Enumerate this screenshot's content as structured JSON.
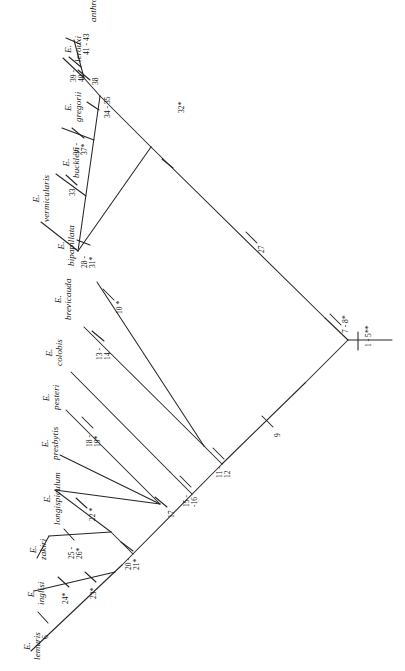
{
  "figure": {
    "type": "cladogram",
    "orientation": "rotated-90-counterclockwise",
    "ingroup_genus": "E."
  },
  "taxa": [
    {
      "id": "anthropopitheci",
      "genus": "E.",
      "species": "anthropopitheci"
    },
    {
      "id": "lerouxi",
      "genus": "E.",
      "species": "lerouxi"
    },
    {
      "id": "gregorii",
      "genus": "E.",
      "species": "gregorii"
    },
    {
      "id": "buckleyi",
      "genus": "E.",
      "species": "buckleyi"
    },
    {
      "id": "vermicularis",
      "genus": "E.",
      "species": "vermicularis"
    },
    {
      "id": "bipapillata",
      "genus": "E.",
      "species": "bipapillata"
    },
    {
      "id": "brevicauda",
      "genus": "E.",
      "species": "brevicauda"
    },
    {
      "id": "colobis",
      "genus": "E.",
      "species": "colobis"
    },
    {
      "id": "pesteri",
      "genus": "E.",
      "species": "pesteri"
    },
    {
      "id": "presbytis",
      "genus": "E.",
      "species": "presbytis"
    },
    {
      "id": "longispiculum",
      "genus": "E.",
      "species": "longispiculum"
    },
    {
      "id": "zakiri",
      "genus": "E.",
      "species": "zakiri"
    },
    {
      "id": "inglisi",
      "genus": "E.",
      "species": "inglisi"
    },
    {
      "id": "lemuris",
      "genus": "E.",
      "species": "lemuris"
    }
  ],
  "node_labels": [
    {
      "id": "n-41-43",
      "lines": [
        "41 - 43"
      ]
    },
    {
      "id": "n-39-40",
      "lines": [
        "39 -",
        "40"
      ]
    },
    {
      "id": "n-38",
      "lines": [
        "38"
      ]
    },
    {
      "id": "n-34-35",
      "lines": [
        "34 - 35"
      ]
    },
    {
      "id": "n-36-37",
      "lines": [
        "36 -",
        "37*"
      ]
    },
    {
      "id": "n-33",
      "lines": [
        "33"
      ]
    },
    {
      "id": "n-32",
      "lines": [
        "32*"
      ]
    },
    {
      "id": "n-28-31",
      "lines": [
        "28 -",
        "31*"
      ]
    },
    {
      "id": "n-27",
      "lines": [
        "27"
      ]
    },
    {
      "id": "n-10",
      "lines": [
        "10 *"
      ]
    },
    {
      "id": "n-13-14",
      "lines": [
        "13 -",
        "14"
      ]
    },
    {
      "id": "n-9",
      "lines": [
        "9"
      ]
    },
    {
      "id": "n-7-8",
      "lines": [
        "7 - 8*"
      ]
    },
    {
      "id": "n-1-5",
      "lines": [
        "1 - 5**"
      ]
    },
    {
      "id": "n-11-12",
      "lines": [
        "11 -",
        "12"
      ]
    },
    {
      "id": "n-15-16",
      "lines": [
        "15 -",
        "-16"
      ]
    },
    {
      "id": "n-18-19",
      "lines": [
        "18 -",
        "19*"
      ]
    },
    {
      "id": "n-17",
      "lines": [
        "17"
      ]
    },
    {
      "id": "n-22",
      "lines": [
        "22 *"
      ]
    },
    {
      "id": "n-20-21",
      "lines": [
        "20 -",
        "21*"
      ]
    },
    {
      "id": "n-25-26",
      "lines": [
        "25 -",
        "26*"
      ]
    },
    {
      "id": "n-23",
      "lines": [
        "23*"
      ]
    },
    {
      "id": "n-24",
      "lines": [
        "24*"
      ]
    },
    {
      "id": "n-6",
      "lines": [
        "6"
      ]
    }
  ],
  "colors": {
    "line": "#262626",
    "text": "#141414",
    "background": "#ffffff"
  }
}
